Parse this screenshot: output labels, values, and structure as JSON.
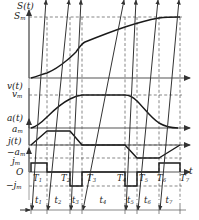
{
  "figure": {
    "type": "motion-profile-diagram",
    "axis_time_label": "t",
    "origin_label": "O"
  },
  "panels": {
    "displacement": {
      "signal_label": "S(t)",
      "max_label": "S",
      "max_sub": "m"
    },
    "velocity": {
      "signal_label": "v(t)",
      "max_label": "v",
      "max_sub": "m"
    },
    "acceleration": {
      "signal_label": "a(t)",
      "max_label": "a",
      "max_sub": "m",
      "min_label": "−a",
      "min_sub": "m"
    },
    "jerk": {
      "signal_label": "j(t)",
      "max_label": "j",
      "max_sub": "m",
      "min_label": "−j",
      "min_sub": "m"
    }
  },
  "phase_marks": [
    {
      "label": "T",
      "sub": "1",
      "x": 33
    },
    {
      "label": "T",
      "sub": "2",
      "x": 61
    },
    {
      "label": "T",
      "sub": "3",
      "x": 87
    },
    {
      "label": "T",
      "sub": "4",
      "x": 117
    },
    {
      "label": "T",
      "sub": "5",
      "x": 139
    },
    {
      "label": "T",
      "sub": "6",
      "x": 157
    },
    {
      "label": "T",
      "sub": "7",
      "x": 180
    }
  ],
  "intervals": [
    {
      "label": "t",
      "sub": "1",
      "start": 31,
      "end": 47
    },
    {
      "label": "t",
      "sub": "2",
      "start": 47,
      "end": 70
    },
    {
      "label": "t",
      "sub": "3",
      "start": 70,
      "end": 82
    },
    {
      "label": "t",
      "sub": "4",
      "start": 82,
      "end": 125
    },
    {
      "label": "t",
      "sub": "5",
      "start": 125,
      "end": 137
    },
    {
      "label": "t",
      "sub": "6",
      "start": 137,
      "end": 159
    },
    {
      "label": "t",
      "sub": "7",
      "start": 159,
      "end": 180
    }
  ],
  "chart_data": {
    "type": "line",
    "title": "",
    "xlabel": "t",
    "ylabel": "",
    "grid": true,
    "legend": "none",
    "gridlines_x": [
      31,
      47,
      70,
      82,
      125,
      137,
      159,
      180
    ],
    "series": [
      {
        "name": "S(t)",
        "ylabel": "S(t)",
        "ymax_label": "Sm",
        "comment": "monotonically increasing displacement from 0 to Sm",
        "points": [
          [
            31,
            0
          ],
          [
            47,
            0.06
          ],
          [
            60,
            0.16
          ],
          [
            70,
            0.24
          ],
          [
            82,
            0.36
          ],
          [
            100,
            0.55
          ],
          [
            125,
            0.76
          ],
          [
            137,
            0.85
          ],
          [
            159,
            0.96
          ],
          [
            180,
            1.0
          ]
        ]
      },
      {
        "name": "v(t)",
        "ylabel": "v(t)",
        "ymax_label": "vm",
        "comment": "trapezoidal velocity with S-curve ramps, flat top at vm",
        "points": [
          [
            31,
            0
          ],
          [
            39,
            0.12
          ],
          [
            47,
            0.33
          ],
          [
            60,
            0.66
          ],
          [
            70,
            0.92
          ],
          [
            78,
            1.0
          ],
          [
            125,
            1.0
          ],
          [
            131,
            0.96
          ],
          [
            137,
            0.86
          ],
          [
            150,
            0.5
          ],
          [
            159,
            0.2
          ],
          [
            168,
            0.05
          ],
          [
            176,
            0
          ]
        ]
      },
      {
        "name": "a(t)",
        "ylabel": "a(t)",
        "ymax_label": "am",
        "ymin_label": "-am",
        "comment": "trapezoidal acceleration: positive pulse then negative pulse",
        "points": [
          [
            31,
            0
          ],
          [
            47,
            1.0
          ],
          [
            70,
            1.0
          ],
          [
            82,
            0
          ],
          [
            125,
            0
          ],
          [
            137,
            -1.0
          ],
          [
            159,
            -1.0
          ],
          [
            180,
            0
          ]
        ]
      },
      {
        "name": "j(t)",
        "ylabel": "j(t)",
        "ymax_label": "jm",
        "ymin_label": "-jm",
        "comment": "rectangular jerk pulses: +jm, 0, -jm, 0, -jm, 0, +jm",
        "points": [
          [
            31,
            1
          ],
          [
            47,
            1
          ],
          [
            47,
            0
          ],
          [
            70,
            0
          ],
          [
            70,
            -1
          ],
          [
            82,
            -1
          ],
          [
            82,
            0
          ],
          [
            125,
            0
          ],
          [
            125,
            -1
          ],
          [
            137,
            -1
          ],
          [
            137,
            0
          ],
          [
            159,
            0
          ],
          [
            159,
            1
          ],
          [
            180,
            1
          ],
          [
            180,
            0
          ]
        ]
      }
    ]
  }
}
